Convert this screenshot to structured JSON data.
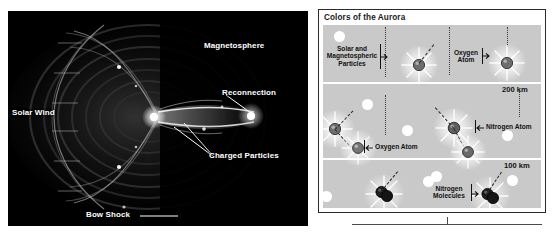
{
  "figure": {
    "left_panel": {
      "name": "magnetosphere-illustration",
      "labels": [
        {
          "id": "magnetosphere",
          "text": "Magnetosphere"
        },
        {
          "id": "solar-wind",
          "text": "Solar Wind"
        },
        {
          "id": "reconnection",
          "text": "Reconnection"
        },
        {
          "id": "charged-particles",
          "text": "Charged Particles"
        },
        {
          "id": "bow-shock",
          "text": "Bow Shock"
        }
      ]
    },
    "right_panel": {
      "title": "Colors of the Aurora",
      "altitudes": [
        {
          "id": "alt-200",
          "text": "200 km"
        },
        {
          "id": "alt-100",
          "text": "100 km"
        }
      ],
      "callouts": [
        {
          "id": "solar-particles",
          "line1": "Solar and",
          "line2": "Magnetospheric",
          "line3": "Particles"
        },
        {
          "id": "oxygen-atom-top",
          "line1": "Oxygen",
          "line2": "Atom"
        },
        {
          "id": "nitrogen-atom",
          "line1": "Nitrogen Atom"
        },
        {
          "id": "oxygen-atom-mid",
          "line1": "Oxygen Atom"
        },
        {
          "id": "nitrogen-molecules",
          "line1": "Nitrogen",
          "line2": "Molecules"
        }
      ]
    },
    "colors": {
      "panel_background": "#c9c9c9",
      "panel_border": "#2b2b2b",
      "band_divider": "#ffffff",
      "left_background": "#000000",
      "label_text_left": "#ffffff",
      "label_text_right": "#111111",
      "oxygen_atom": "#6e6e6e",
      "nitrogen_atom": "#5a5a5a",
      "nitrogen_molecule": "#1c1c1c",
      "particle_dot": "#ffffff"
    }
  }
}
